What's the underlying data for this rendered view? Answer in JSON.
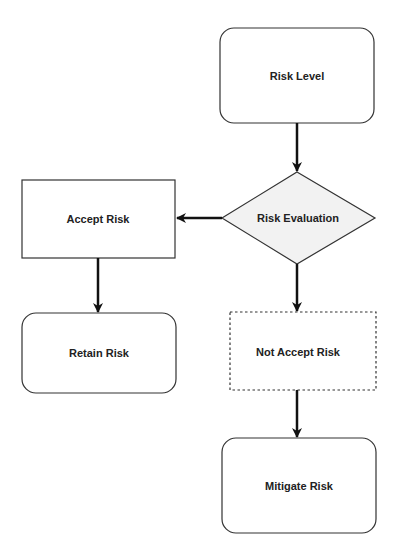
{
  "diagram": {
    "colors": {
      "stroke": "#333333",
      "arrow": "#111111",
      "decision_fill": "#f2f2f2",
      "node_fill": "#ffffff"
    },
    "nodes": {
      "risk_level": {
        "label": "Risk Level",
        "shape": "rounded-rect"
      },
      "risk_evaluation": {
        "label": "Risk Evaluation",
        "shape": "diamond"
      },
      "accept_risk": {
        "label": "Accept Risk",
        "shape": "rect"
      },
      "retain_risk": {
        "label": "Retain Risk",
        "shape": "rounded-rect"
      },
      "not_accept_risk": {
        "label": "Not Accept Risk",
        "shape": "dashed-rect"
      },
      "mitigate_risk": {
        "label": "Mitigate Risk",
        "shape": "rounded-rect"
      }
    },
    "edges": [
      {
        "from": "Risk Level",
        "to": "Risk Evaluation"
      },
      {
        "from": "Risk Evaluation",
        "to": "Accept Risk"
      },
      {
        "from": "Risk Evaluation",
        "to": "Not Accept Risk"
      },
      {
        "from": "Accept Risk",
        "to": "Retain Risk"
      },
      {
        "from": "Not Accept Risk",
        "to": "Mitigate Risk"
      }
    ]
  }
}
